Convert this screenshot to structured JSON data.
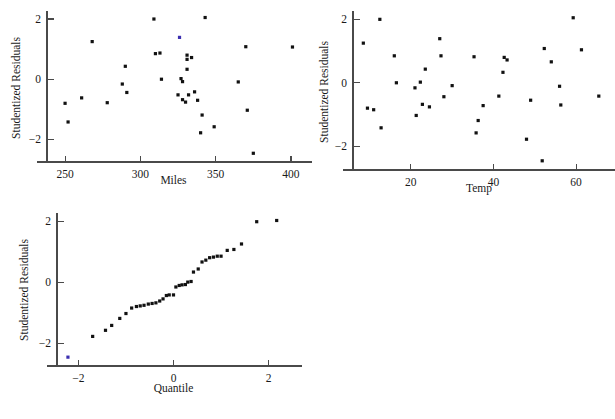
{
  "figure": {
    "background": "#ffffff",
    "point_color": "#111111",
    "highlight_color": "#3b2fb0",
    "axis_color": "#4a4a4a"
  },
  "chart_data": [
    {
      "id": "residuals-vs-miles",
      "type": "scatter",
      "title": "",
      "xlabel": "Miles",
      "ylabel": "Studentized Residuals",
      "xlim": [
        238,
        406
      ],
      "ylim": [
        -2.75,
        2.2
      ],
      "xticks": [
        250,
        300,
        350,
        400
      ],
      "yticks": [
        2,
        0,
        -2
      ],
      "xticklabels": [
        "250",
        "300",
        "350",
        "400"
      ],
      "yticklabels": [
        "2",
        "0",
        "−2"
      ],
      "grid": false,
      "legend": "none",
      "points": [
        {
          "x": 250,
          "y": -0.8
        },
        {
          "x": 252,
          "y": -1.42
        },
        {
          "x": 261,
          "y": -0.62
        },
        {
          "x": 268,
          "y": 1.25
        },
        {
          "x": 278,
          "y": -0.78
        },
        {
          "x": 288,
          "y": -0.16
        },
        {
          "x": 290,
          "y": 0.43
        },
        {
          "x": 291,
          "y": -0.44
        },
        {
          "x": 309,
          "y": 2.0
        },
        {
          "x": 310,
          "y": 0.85
        },
        {
          "x": 313,
          "y": 0.87
        },
        {
          "x": 314,
          "y": 0.0
        },
        {
          "x": 325,
          "y": -0.52
        },
        {
          "x": 326,
          "y": 1.39,
          "highlight": true
        },
        {
          "x": 327,
          "y": 0.02
        },
        {
          "x": 328,
          "y": -0.08
        },
        {
          "x": 328,
          "y": -0.68
        },
        {
          "x": 330,
          "y": -0.76
        },
        {
          "x": 331,
          "y": 0.8
        },
        {
          "x": 331,
          "y": 0.66
        },
        {
          "x": 331,
          "y": 0.33
        },
        {
          "x": 332,
          "y": -0.52
        },
        {
          "x": 334,
          "y": 0.72
        },
        {
          "x": 336,
          "y": -0.42
        },
        {
          "x": 338,
          "y": -0.7
        },
        {
          "x": 340,
          "y": -1.78
        },
        {
          "x": 341,
          "y": -1.19
        },
        {
          "x": 343,
          "y": 2.05
        },
        {
          "x": 349,
          "y": -1.58
        },
        {
          "x": 365,
          "y": -0.09
        },
        {
          "x": 370,
          "y": 1.08
        },
        {
          "x": 371,
          "y": -1.03
        },
        {
          "x": 375,
          "y": -2.46
        },
        {
          "x": 401,
          "y": 1.07
        }
      ]
    },
    {
      "id": "residuals-vs-temp",
      "type": "scatter",
      "title": "",
      "xlabel": "Temp",
      "ylabel": "Studentized Residuals",
      "xlim": [
        6,
        67
      ],
      "ylim": [
        -2.75,
        2.2
      ],
      "xticks": [
        20,
        40,
        60
      ],
      "yticks": [
        2,
        0,
        -2
      ],
      "xticklabels": [
        "20",
        "40",
        "60"
      ],
      "yticklabels": [
        "2",
        "0",
        "−2"
      ],
      "grid": false,
      "legend": "none",
      "points": [
        {
          "x": 8.5,
          "y": 1.25
        },
        {
          "x": 9.5,
          "y": -0.8
        },
        {
          "x": 11.0,
          "y": -0.85
        },
        {
          "x": 12.5,
          "y": 2.0
        },
        {
          "x": 12.8,
          "y": -1.42
        },
        {
          "x": 16.0,
          "y": 0.85
        },
        {
          "x": 16.5,
          "y": 0.0
        },
        {
          "x": 21.0,
          "y": -0.16
        },
        {
          "x": 21.3,
          "y": -1.03
        },
        {
          "x": 22.3,
          "y": 0.02
        },
        {
          "x": 22.8,
          "y": -0.68
        },
        {
          "x": 23.5,
          "y": 0.43
        },
        {
          "x": 24.5,
          "y": -0.76
        },
        {
          "x": 27.0,
          "y": 1.39
        },
        {
          "x": 27.3,
          "y": 0.85
        },
        {
          "x": 28.0,
          "y": -0.44
        },
        {
          "x": 30.0,
          "y": -0.09
        },
        {
          "x": 35.3,
          "y": 0.82
        },
        {
          "x": 35.8,
          "y": -1.58
        },
        {
          "x": 36.3,
          "y": -1.19
        },
        {
          "x": 37.5,
          "y": -0.72
        },
        {
          "x": 41.3,
          "y": -0.42
        },
        {
          "x": 42.3,
          "y": 0.33
        },
        {
          "x": 42.6,
          "y": 0.8
        },
        {
          "x": 43.3,
          "y": 0.72
        },
        {
          "x": 48.0,
          "y": -1.78
        },
        {
          "x": 49.0,
          "y": -0.55
        },
        {
          "x": 51.8,
          "y": -2.46
        },
        {
          "x": 52.3,
          "y": 1.08
        },
        {
          "x": 54.0,
          "y": 0.66
        },
        {
          "x": 56.0,
          "y": -0.11
        },
        {
          "x": 56.3,
          "y": -0.7
        },
        {
          "x": 59.3,
          "y": 2.05
        },
        {
          "x": 61.3,
          "y": 1.04
        },
        {
          "x": 65.5,
          "y": -0.42
        }
      ]
    },
    {
      "id": "normal-qq-plot",
      "type": "scatter",
      "title": "",
      "xlabel": "Quantile",
      "ylabel": "Studentized Residuals",
      "xlim": [
        -2.45,
        2.45
      ],
      "ylim": [
        -2.75,
        2.2
      ],
      "xticks": [
        -2,
        0,
        2
      ],
      "yticks": [
        2,
        0,
        -2
      ],
      "xticklabels": [
        "−2",
        "0",
        "2"
      ],
      "yticklabels": [
        "2",
        "0",
        "−2"
      ],
      "grid": false,
      "legend": "none",
      "points": [
        {
          "x": -2.22,
          "y": -2.46,
          "highlight": true
        },
        {
          "x": -1.7,
          "y": -1.78
        },
        {
          "x": -1.43,
          "y": -1.58
        },
        {
          "x": -1.3,
          "y": -1.42
        },
        {
          "x": -1.13,
          "y": -1.19
        },
        {
          "x": -1.0,
          "y": -1.03
        },
        {
          "x": -0.88,
          "y": -0.85
        },
        {
          "x": -0.78,
          "y": -0.8
        },
        {
          "x": -0.7,
          "y": -0.78
        },
        {
          "x": -0.62,
          "y": -0.76
        },
        {
          "x": -0.53,
          "y": -0.72
        },
        {
          "x": -0.45,
          "y": -0.7
        },
        {
          "x": -0.37,
          "y": -0.68
        },
        {
          "x": -0.29,
          "y": -0.62
        },
        {
          "x": -0.22,
          "y": -0.55
        },
        {
          "x": -0.15,
          "y": -0.44
        },
        {
          "x": -0.09,
          "y": -0.42
        },
        {
          "x": 0.0,
          "y": -0.42
        },
        {
          "x": 0.05,
          "y": -0.16
        },
        {
          "x": 0.12,
          "y": -0.11
        },
        {
          "x": 0.18,
          "y": -0.09
        },
        {
          "x": 0.25,
          "y": -0.08
        },
        {
          "x": 0.3,
          "y": 0.0
        },
        {
          "x": 0.37,
          "y": 0.02
        },
        {
          "x": 0.42,
          "y": 0.33
        },
        {
          "x": 0.52,
          "y": 0.43
        },
        {
          "x": 0.6,
          "y": 0.66
        },
        {
          "x": 0.68,
          "y": 0.72
        },
        {
          "x": 0.76,
          "y": 0.8
        },
        {
          "x": 0.84,
          "y": 0.82
        },
        {
          "x": 0.92,
          "y": 0.85
        },
        {
          "x": 1.0,
          "y": 0.85
        },
        {
          "x": 1.13,
          "y": 1.04
        },
        {
          "x": 1.27,
          "y": 1.07
        },
        {
          "x": 1.43,
          "y": 1.25
        },
        {
          "x": 1.75,
          "y": 1.98
        },
        {
          "x": 2.17,
          "y": 2.02
        }
      ]
    }
  ]
}
